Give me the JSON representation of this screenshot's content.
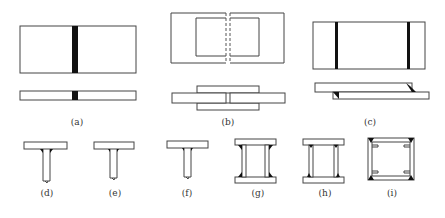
{
  "figure": {
    "panels": [
      {
        "id": "a",
        "label": "(a)",
        "type": "butt-weld"
      },
      {
        "id": "b",
        "label": "(b)",
        "type": "double-cover-plate-lap-joint"
      },
      {
        "id": "c",
        "label": "(c)",
        "type": "lap-joint-fillet-welds"
      },
      {
        "id": "d",
        "label": "(d)",
        "type": "t-joint-fillet-large"
      },
      {
        "id": "e",
        "label": "(e)",
        "type": "t-joint-fillet-small"
      },
      {
        "id": "f",
        "label": "(f)",
        "type": "t-joint-fillet-small"
      },
      {
        "id": "g",
        "label": "(g)",
        "type": "box-section-fillet-outside"
      },
      {
        "id": "h",
        "label": "(h)",
        "type": "box-section-fillet-inside"
      },
      {
        "id": "i",
        "label": "(i)",
        "type": "box-section-corner-welds"
      }
    ],
    "colors": {
      "line": "#444444",
      "weld": "#111111",
      "background": "#ffffff"
    }
  }
}
